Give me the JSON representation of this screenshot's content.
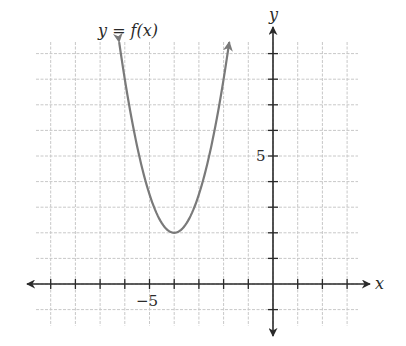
{
  "chart_data": {
    "type": "line",
    "title": "",
    "curve_label": "y = f(x)",
    "xlabel": "x",
    "ylabel": "y",
    "xlim": [
      -9.5,
      3.5
    ],
    "ylim": [
      -1.5,
      9.8
    ],
    "x_tick_labels": [
      {
        "value": -5,
        "label": "−5"
      }
    ],
    "y_tick_labels": [
      {
        "value": 5,
        "label": "5"
      }
    ],
    "grid": true,
    "grid_step": 1,
    "series": [
      {
        "name": "f(x)",
        "equation": "f(x) = 1.5(x + 4)^2 + 2 (approx.)",
        "vertex": [
          -4,
          2
        ],
        "x": [
          -6.1,
          -6,
          -5.5,
          -5,
          -4.5,
          -4,
          -3.5,
          -3,
          -2.5,
          -2,
          -1.9
        ],
        "y": [
          8.6,
          8.0,
          5.4,
          3.5,
          2.4,
          2.0,
          2.4,
          3.5,
          5.4,
          8.0,
          8.6
        ],
        "end_arrows": true,
        "color": "#7a7a7a"
      }
    ]
  },
  "labels": {
    "curve": "y = f(x)",
    "x_axis": "x",
    "y_axis": "y",
    "x_tick": "−5",
    "y_tick": "5"
  },
  "colors": {
    "axis": "#2a2a2a",
    "grid": "#c8c8c8",
    "curve": "#7a7a7a"
  }
}
